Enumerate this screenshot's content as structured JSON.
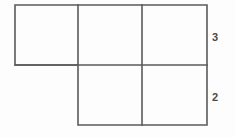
{
  "figure": {
    "background_color": "#fdfdfd",
    "stroke_color": "#5a5a5a",
    "stroke_width": 1.6,
    "label_color": "#4a4a4a",
    "viewbox": {
      "width": 235,
      "height": 137
    },
    "geometry": {
      "x_left": 15,
      "x_div1": 78,
      "x_div2": 142,
      "x_right": 207,
      "y_top": 5,
      "y_mid": 65,
      "y_bottom": 125
    },
    "outline_path": "M 15 5 L 207 5 L 207 125 L 78 125 L 78 65 L 15 65 Z",
    "inner_segments": [
      {
        "name": "vertical-divider-1",
        "x1": 78,
        "y1": 5,
        "x2": 78,
        "y2": 65
      },
      {
        "name": "vertical-divider-2",
        "x1": 142,
        "y1": 5,
        "x2": 142,
        "y2": 125
      },
      {
        "name": "horizontal-divider",
        "x1": 15,
        "y1": 65,
        "x2": 207,
        "y2": 65
      }
    ],
    "cells": [
      {
        "name": "cell-top-left",
        "x": 15,
        "y": 5,
        "w": 63,
        "h": 60
      },
      {
        "name": "cell-top-middle",
        "x": 78,
        "y": 5,
        "w": 64,
        "h": 60
      },
      {
        "name": "cell-top-right",
        "x": 142,
        "y": 5,
        "w": 65,
        "h": 60
      },
      {
        "name": "cell-bottom-middle",
        "x": 78,
        "y": 65,
        "w": 64,
        "h": 60
      },
      {
        "name": "cell-bottom-right",
        "x": 142,
        "y": 65,
        "w": 65,
        "h": 60
      }
    ]
  },
  "labels": {
    "top_row_dimension": "3",
    "bottom_row_dimension": "2"
  },
  "chart_data": {
    "type": "diagram",
    "rows": [
      {
        "name": "top-row",
        "cell_count": 3,
        "height_label": "3"
      },
      {
        "name": "bottom-row",
        "cell_count": 2,
        "height_label": "2"
      }
    ],
    "annotations": [
      {
        "text": "3",
        "position": "right of top row",
        "x": 214,
        "y": 38
      },
      {
        "text": "2",
        "position": "right of bottom row",
        "x": 214,
        "y": 98
      }
    ]
  }
}
